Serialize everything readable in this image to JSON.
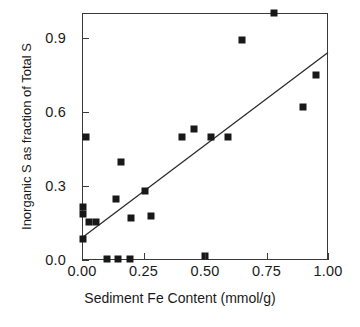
{
  "chart_data": {
    "type": "scatter",
    "title": "",
    "xlabel": "Sediment Fe Content (mmol/g)",
    "ylabel": "Inorganic S as fraction of Total S",
    "xlim": [
      0.0,
      1.0
    ],
    "ylim": [
      0.0,
      1.0
    ],
    "grid": false,
    "legend": null,
    "xticks": [
      0.0,
      0.25,
      0.5,
      0.75,
      1.0
    ],
    "xticklabels": [
      "0.00",
      "0.25",
      "0.50",
      "0.75",
      "1.00"
    ],
    "yticks": [
      0.0,
      0.3,
      0.6,
      0.9
    ],
    "yticklabels": [
      "0.0",
      "0.3",
      "0.6",
      "0.9"
    ],
    "marker": "square",
    "marker_color": "#181818",
    "points": [
      {
        "x": 0.005,
        "y": 0.085
      },
      {
        "x": 0.005,
        "y": 0.185
      },
      {
        "x": 0.005,
        "y": 0.215
      },
      {
        "x": 0.015,
        "y": 0.5
      },
      {
        "x": 0.03,
        "y": 0.155
      },
      {
        "x": 0.055,
        "y": 0.155
      },
      {
        "x": 0.1,
        "y": 0.005
      },
      {
        "x": 0.145,
        "y": 0.005
      },
      {
        "x": 0.14,
        "y": 0.245
      },
      {
        "x": 0.16,
        "y": 0.395
      },
      {
        "x": 0.195,
        "y": 0.005
      },
      {
        "x": 0.2,
        "y": 0.17
      },
      {
        "x": 0.255,
        "y": 0.28
      },
      {
        "x": 0.28,
        "y": 0.18
      },
      {
        "x": 0.405,
        "y": 0.5
      },
      {
        "x": 0.455,
        "y": 0.53
      },
      {
        "x": 0.5,
        "y": 0.015
      },
      {
        "x": 0.525,
        "y": 0.5
      },
      {
        "x": 0.595,
        "y": 0.5
      },
      {
        "x": 0.65,
        "y": 0.89
      },
      {
        "x": 0.78,
        "y": 1.0
      },
      {
        "x": 0.9,
        "y": 0.62
      },
      {
        "x": 0.95,
        "y": 0.75
      }
    ],
    "fit_line": {
      "type": "linear-regression",
      "x_start": 0.0,
      "y_start": 0.09,
      "x_end": 1.0,
      "y_end": 0.84,
      "color": "#2b2b2b"
    }
  },
  "page": {
    "bleed_text": ""
  }
}
